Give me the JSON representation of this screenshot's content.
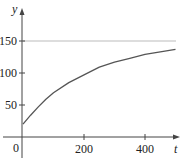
{
  "chart_data": {
    "type": "line",
    "title": "",
    "xlabel": "t",
    "ylabel": "y",
    "xlim": [
      0,
      500
    ],
    "ylim": [
      0,
      170
    ],
    "x_ticks": [
      200,
      400
    ],
    "y_ticks": [
      50,
      100,
      150
    ],
    "origin_label": "0",
    "grid": false,
    "legend": null,
    "series": [
      {
        "name": "curve",
        "x": [
          0,
          25,
          50,
          75,
          100,
          150,
          200,
          250,
          300,
          350,
          400,
          450,
          500
        ],
        "values": [
          20,
          34,
          47,
          59,
          69,
          85,
          97,
          109,
          117,
          123,
          129,
          133,
          137
        ]
      }
    ],
    "reference_lines": [
      {
        "orientation": "horizontal",
        "y": 150,
        "label": "asymptote"
      }
    ],
    "colors": {
      "curve": "#555555",
      "asymptote": "#bbbbbb",
      "axis": "#444444"
    }
  }
}
